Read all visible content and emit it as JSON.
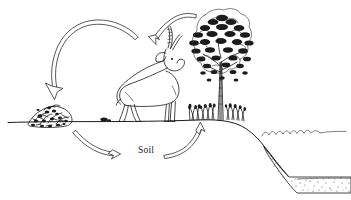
{
  "diagram": {
    "canvas": {
      "width": 351,
      "height": 200,
      "background": "#ffffff"
    },
    "ink_color": "#1b1b1b",
    "labels": [
      {
        "id": "soil",
        "text": "Soil",
        "x": 138,
        "y": 151
      }
    ],
    "elements": [
      {
        "id": "ground-line",
        "name": "ground-surface-line",
        "kind": "terrain",
        "text": ""
      },
      {
        "id": "litter-mound",
        "name": "litter-detritus-mound",
        "kind": "organic-matter",
        "text": ""
      },
      {
        "id": "antelope",
        "name": "antelope-herbivore",
        "kind": "animal",
        "text": ""
      },
      {
        "id": "tree",
        "name": "broadleaf-tree",
        "kind": "plant",
        "text": ""
      },
      {
        "id": "grass-clump",
        "name": "grass-clump",
        "kind": "plant",
        "text": ""
      },
      {
        "id": "dung",
        "name": "dung-pellets",
        "kind": "organic-matter",
        "text": ""
      },
      {
        "id": "water",
        "name": "water-surface-waves",
        "kind": "water",
        "text": ""
      },
      {
        "id": "sediment",
        "name": "sediment-deposit-layer",
        "kind": "sediment",
        "text": ""
      }
    ],
    "arrows": [
      {
        "id": "arrow-browse",
        "name": "arrow-tree-to-animal",
        "from": "tree",
        "to": "antelope",
        "text": ""
      },
      {
        "id": "arrow-litterfall",
        "name": "arrow-animal-to-litter",
        "from": "antelope",
        "to": "litter-mound",
        "text": ""
      },
      {
        "id": "arrow-decompose",
        "name": "arrow-litter-to-soil",
        "from": "litter-mound",
        "to": "soil",
        "text": ""
      },
      {
        "id": "arrow-uptake",
        "name": "arrow-soil-to-plants",
        "from": "soil",
        "to": "grass-clump",
        "text": ""
      }
    ]
  }
}
